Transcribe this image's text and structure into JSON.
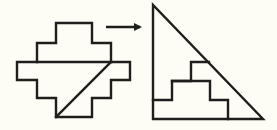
{
  "diagram": {
    "colors": {
      "background": "#fdfdf6",
      "stroke": "#1e1e1a"
    },
    "left_shape": {
      "name": "stepped-figure",
      "outline": "56,23 92,23 92,43 111,43 111,62 130,62 130,80 111,80 111,98 92,98 92,117 56,117 56,98 37,98 37,80 17,80 17,62 37,62 37,43 56,43",
      "band_line": {
        "x1": 37,
        "y1": 62,
        "x2": 111,
        "y2": 62
      },
      "diagonal_cut": {
        "x1": 111,
        "y1": 62,
        "x2": 56,
        "y2": 117
      }
    },
    "arrow": {
      "x1": 106,
      "y1": 27,
      "x2": 140,
      "y2": 27,
      "direction": "right"
    },
    "right_shape": {
      "name": "right-triangle",
      "outline": "153,5 153,119 263,119",
      "inner_staircase": "153,100 172,100 172,81 191,81 191,62 209,62",
      "inner_step_down": "172,81 210,81 210,100 228,100 228,119"
    }
  }
}
